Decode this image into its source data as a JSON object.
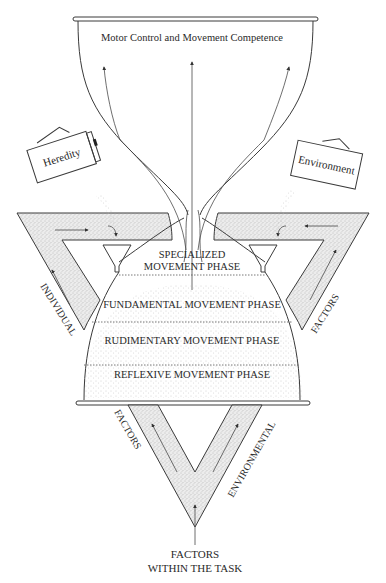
{
  "diagram": {
    "cup_title": "Motor Control and Movement Competence",
    "containers": {
      "left_label": "Heredity",
      "right_label": "Environment"
    },
    "phases": [
      {
        "line1": "SPECIALIZED",
        "line2": "MOVEMENT PHASE"
      },
      {
        "line1": "FUNDAMENTAL MOVEMENT PHASE"
      },
      {
        "line1": "RUDIMENTARY MOVEMENT PHASE"
      },
      {
        "line1": "REFLEXIVE MOVEMENT PHASE"
      }
    ],
    "triangle_labels": {
      "left_outer": "INDIVIDUAL",
      "right_outer": "FACTORS",
      "bottom_left": "FACTORS",
      "bottom_right": "ENVIRONMENTAL"
    },
    "bottom_label": {
      "line1": "FACTORS",
      "line2": "WITHIN THE TASK"
    }
  }
}
